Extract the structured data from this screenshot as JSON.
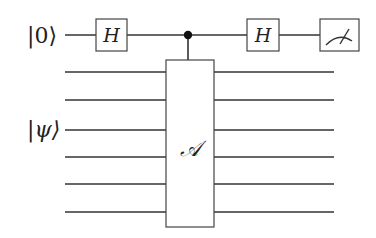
{
  "diagram": {
    "type": "quantum-circuit",
    "inputs": {
      "control_qubit": "|0⟩",
      "target_register": "|ψ⟩"
    },
    "gates": {
      "hadamard_1": "H",
      "controlled_operation": "𝒜",
      "hadamard_2": "H",
      "measurement": "measure"
    },
    "target_wire_count": 6,
    "colors": {
      "line": "#333333",
      "background": "#ffffff"
    }
  }
}
